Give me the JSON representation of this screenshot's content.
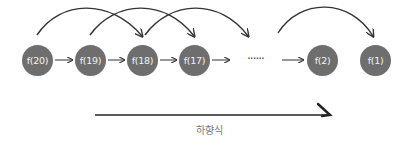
{
  "diagram": {
    "title": "",
    "node_color": "#6e6e6e",
    "node_text_color": "#f2f2f2",
    "line_color": "#333333",
    "nodes": [
      {
        "id": "f20",
        "label": "f(20)",
        "cx": 37,
        "cy": 60
      },
      {
        "id": "f19",
        "label": "f(19)",
        "cx": 90,
        "cy": 60
      },
      {
        "id": "f18",
        "label": "f(18)",
        "cx": 142,
        "cy": 60
      },
      {
        "id": "f17",
        "label": "f(17)",
        "cx": 194,
        "cy": 60
      },
      {
        "id": "f2",
        "label": "f(2)",
        "cx": 322,
        "cy": 60
      },
      {
        "id": "f1",
        "label": "f(1)",
        "cx": 375,
        "cy": 60
      }
    ],
    "ellipsis": "······",
    "straight_edges": [
      {
        "from": "f20",
        "to": "f19"
      },
      {
        "from": "f19",
        "to": "f18"
      },
      {
        "from": "f18",
        "to": "f17"
      },
      {
        "from": "f17",
        "to": "ellipsis"
      },
      {
        "from": "ellipsis",
        "to": "f2"
      }
    ],
    "curved_edges": [
      {
        "from": "f20",
        "to": "f18"
      },
      {
        "from": "f19",
        "to": "f17"
      },
      {
        "from": "f18",
        "to": "ellipsis"
      },
      {
        "from": "ellipsis",
        "to": "f1"
      }
    ],
    "direction_arrow": {
      "label": "하향식",
      "direction": "left-to-right"
    }
  }
}
